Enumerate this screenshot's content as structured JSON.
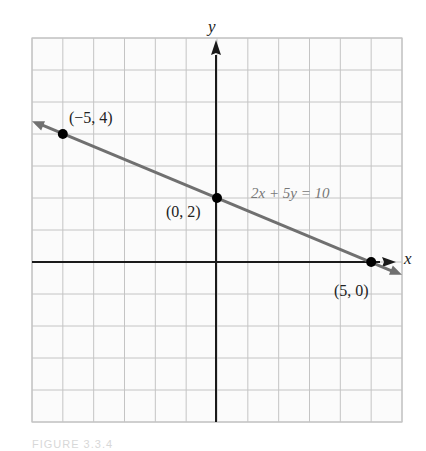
{
  "chart_data": {
    "type": "line",
    "title": "",
    "equation": "2x + 5y = 10",
    "xlabel": "x",
    "ylabel": "y",
    "xlim": [
      -6,
      6
    ],
    "ylim": [
      -5,
      7
    ],
    "grid": true,
    "series": [
      {
        "name": "2x + 5y = 10",
        "x": [
          -6,
          -5,
          0,
          5,
          6
        ],
        "y": [
          4.4,
          4,
          2,
          0,
          -0.4
        ]
      }
    ],
    "points": [
      {
        "x": -5,
        "y": 4,
        "label": "(−5, 4)"
      },
      {
        "x": 0,
        "y": 2,
        "label": "(0, 2)"
      },
      {
        "x": 5,
        "y": 0,
        "label": "(5, 0)"
      }
    ],
    "colors": {
      "line": "#707070",
      "axes": "#1a1a1a",
      "grid": "#c4c4c4",
      "points": "#000000"
    }
  },
  "labels": {
    "x_axis": "x",
    "y_axis": "y",
    "equation": "2x + 5y = 10",
    "point_a": "(−5, 4)",
    "point_b": "(0, 2)",
    "point_c": "(5, 0)",
    "caption": "FIGURE 3.3.4"
  }
}
